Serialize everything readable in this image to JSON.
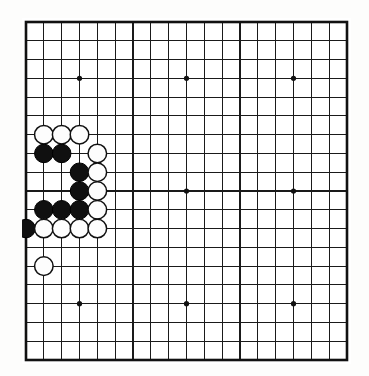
{
  "board": {
    "name": "go-board",
    "size": 19,
    "columns": 19,
    "rows": 19,
    "line_color": "#1a1a1a",
    "border_color": "#111111",
    "background_color": "#ffffff",
    "black_stone_color": "#101010",
    "white_stone_color": "#fdfdfd",
    "star_points": [
      {
        "col": 4,
        "row": 4
      },
      {
        "col": 10,
        "row": 4
      },
      {
        "col": 16,
        "row": 4
      },
      {
        "col": 4,
        "row": 10
      },
      {
        "col": 10,
        "row": 10
      },
      {
        "col": 16,
        "row": 10
      },
      {
        "col": 4,
        "row": 16
      },
      {
        "col": 10,
        "row": 16
      },
      {
        "col": 16,
        "row": 16
      }
    ],
    "stones": [
      {
        "color": "white",
        "col": 2,
        "row": 7
      },
      {
        "color": "white",
        "col": 3,
        "row": 7
      },
      {
        "color": "white",
        "col": 4,
        "row": 7
      },
      {
        "color": "black",
        "col": 2,
        "row": 8
      },
      {
        "color": "black",
        "col": 3,
        "row": 8
      },
      {
        "color": "white",
        "col": 5,
        "row": 8
      },
      {
        "color": "black",
        "col": 4,
        "row": 9
      },
      {
        "color": "white",
        "col": 5,
        "row": 9
      },
      {
        "color": "black",
        "col": 4,
        "row": 10
      },
      {
        "color": "white",
        "col": 5,
        "row": 10
      },
      {
        "color": "black",
        "col": 2,
        "row": 11
      },
      {
        "color": "black",
        "col": 3,
        "row": 11
      },
      {
        "color": "black",
        "col": 4,
        "row": 11
      },
      {
        "color": "white",
        "col": 5,
        "row": 11
      },
      {
        "color": "black",
        "col": 1,
        "row": 12
      },
      {
        "color": "white",
        "col": 2,
        "row": 12
      },
      {
        "color": "white",
        "col": 3,
        "row": 12
      },
      {
        "color": "white",
        "col": 4,
        "row": 12
      },
      {
        "color": "white",
        "col": 5,
        "row": 12
      },
      {
        "color": "white",
        "col": 2,
        "row": 14
      }
    ],
    "counts": {
      "black_stones": 8,
      "white_stones": 12,
      "total_stones": 20
    }
  }
}
